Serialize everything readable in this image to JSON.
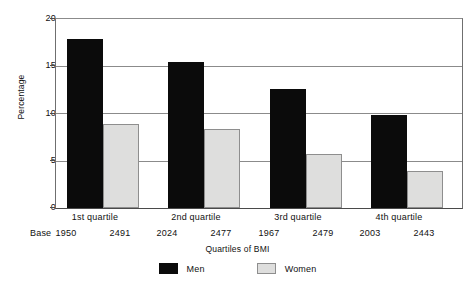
{
  "chart_data": {
    "type": "bar",
    "title": "",
    "xlabel": "Quartiles of BMI",
    "ylabel": "Percentage",
    "ylim": [
      0,
      20
    ],
    "yticks": [
      0,
      5,
      10,
      15,
      20
    ],
    "ytick_labels": [
      "0",
      "5",
      "10",
      "15",
      "20"
    ],
    "grid": true,
    "legend_position": "bottom-center",
    "categories": [
      "1st quartile",
      "2nd quartile",
      "3rd quartile",
      "4th quartile"
    ],
    "series": [
      {
        "name": "Men",
        "color": "#0b0b0b",
        "values": [
          17.9,
          15.4,
          12.6,
          9.8
        ],
        "bases": [
          "1950",
          "2024",
          "1967",
          "2003"
        ]
      },
      {
        "name": "Women",
        "color": "#dededd",
        "values": [
          8.9,
          8.4,
          5.7,
          3.9
        ],
        "bases": [
          "2491",
          "2477",
          "2479",
          "2443"
        ]
      }
    ],
    "base_row_label": "Base"
  },
  "legend": {
    "items": [
      {
        "label": "Men",
        "swatch": "men"
      },
      {
        "label": "Women",
        "swatch": "women"
      }
    ]
  }
}
